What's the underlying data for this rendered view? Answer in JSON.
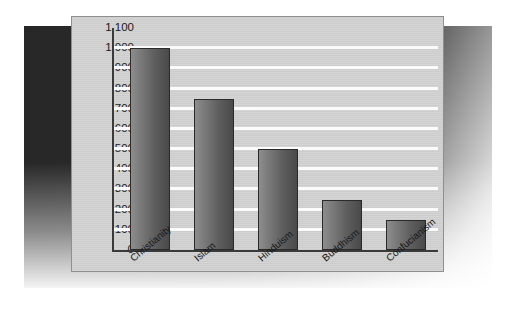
{
  "chart_data": {
    "type": "bar",
    "title": "",
    "subtitle": "",
    "xlabel": "",
    "ylabel": "",
    "categories": [
      "Christianity",
      "Islam",
      "Hinduism",
      "Buddhism",
      "Confucianism"
    ],
    "values": [
      1000,
      750,
      500,
      250,
      150
    ],
    "ylim": [
      0,
      1100
    ],
    "ytick_step": 100,
    "ytick_labels": [
      "1,100",
      "1,000",
      "900",
      "800",
      "700",
      "600",
      "500",
      "400",
      "300",
      "200",
      "100",
      "0"
    ],
    "ytick_values": [
      1100,
      1000,
      900,
      800,
      700,
      600,
      500,
      400,
      300,
      200,
      100,
      0
    ],
    "grid": "horizontal",
    "legend": "none",
    "series": [
      {
        "name": "Adherents (millions)",
        "values": [
          1000,
          750,
          500,
          250,
          150
        ]
      }
    ],
    "colors": {
      "panel_background": "#d3d3d3",
      "gridline": "#fbfbfb",
      "axis": "#3a3a3a",
      "bar_light": "#8d8d8d",
      "bar_dark": "#4a4a4a",
      "bar_outline": "#2a2a2a",
      "backdrop": "#2b2b2b",
      "page_background": "#ffffff",
      "text": "#1b1b1b"
    }
  }
}
